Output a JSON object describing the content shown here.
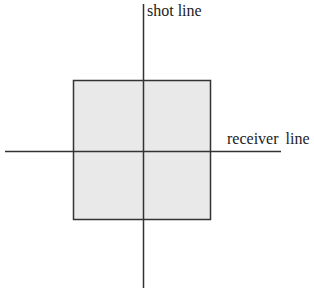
{
  "diagram": {
    "labels": {
      "shot_line": "shot line",
      "receiver_line": "receiver line"
    },
    "colors": {
      "square_fill": "#e9e9e9",
      "line": "#333333",
      "background": "#ffffff"
    },
    "square": {
      "x": 73,
      "y": 80,
      "width": 138,
      "height": 140
    },
    "shot_line_axis": {
      "x": 143,
      "y1": 4,
      "y2": 288
    },
    "receiver_line_axis": {
      "y": 151,
      "x1": 5,
      "x2": 281
    }
  }
}
